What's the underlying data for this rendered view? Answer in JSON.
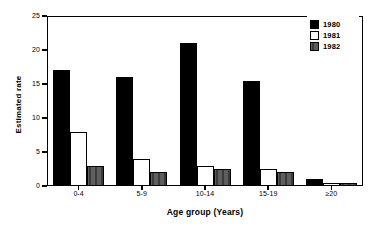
{
  "chart_data": {
    "type": "bar",
    "title": "",
    "xlabel": "Age group (Years)",
    "ylabel": "Estimated rate",
    "categories": [
      "0-4",
      "5-9",
      "10-14",
      "15-19",
      "≥20"
    ],
    "series": [
      {
        "name": "1980",
        "color": "#000000",
        "values": [
          17,
          16,
          21,
          15.5,
          1
        ]
      },
      {
        "name": "1981",
        "color": "#ffffff",
        "values": [
          8,
          4,
          3,
          2.5,
          0.5
        ]
      },
      {
        "name": "1982",
        "color": "#4d4d4d",
        "values": [
          3,
          2,
          2.5,
          2,
          0.5
        ]
      }
    ],
    "ylim": [
      0,
      25
    ],
    "yticks": [
      0,
      5,
      10,
      15,
      20,
      25
    ],
    "ytick_labels": [
      "0",
      "5",
      "10",
      "15",
      "20",
      "25"
    ],
    "grid": false,
    "legend_position": "top-right",
    "legend_entries": [
      "1980",
      "1981",
      "1982"
    ]
  }
}
